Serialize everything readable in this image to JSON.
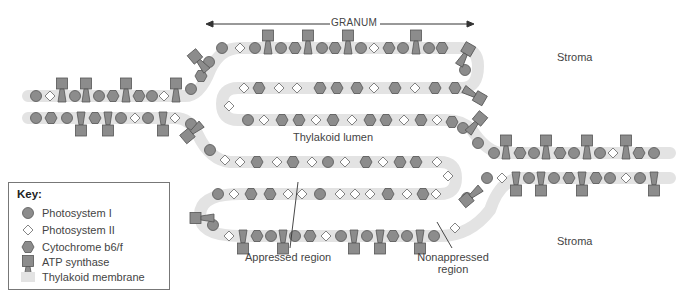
{
  "labels": {
    "granum": "GRANUM",
    "stroma_top": "Stroma",
    "stroma_bottom": "Stroma",
    "thylakoid_lumen": "Thylakoid lumen",
    "appressed_region": "Appressed region",
    "nonappressed_region_line1": "Nonappressed",
    "nonappressed_region_line2": "region"
  },
  "key": {
    "title": "Key:",
    "items": [
      {
        "icon": "circle-icon",
        "label": "Photosystem I"
      },
      {
        "icon": "diamond-icon",
        "label": "Photosystem II"
      },
      {
        "icon": "hexagon-icon",
        "label": "Cytochrome b6/f"
      },
      {
        "icon": "atp-synthase-icon",
        "label": "ATP synthase"
      },
      {
        "icon": "membrane-swatch-icon",
        "label": "Thylakoid membrane"
      }
    ]
  },
  "colors": {
    "protein_fill": "#8c8c8c",
    "protein_stroke": "#555555",
    "diamond_fill": "#ffffff",
    "membrane": "#e3e3e3",
    "text": "#444444"
  }
}
